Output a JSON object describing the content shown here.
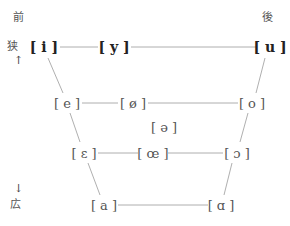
{
  "axes": {
    "front": "前",
    "back": "後",
    "close": "狭",
    "open": "広",
    "up_arrow": "↑",
    "down_arrow": "↓"
  },
  "vowels": {
    "i": "[ i ]",
    "y": "[ y ]",
    "u": "[ u ]",
    "e": "[ e ]",
    "o_slash": "[ ø ]",
    "o": "[ o ]",
    "schwa": "[ ə ]",
    "epsilon": "[ ɛ ]",
    "oe": "[ œ ]",
    "open_o": "[ ɔ ]",
    "a": "[ a ]",
    "alpha": "[ ɑ ]"
  },
  "colors": {
    "line": "#9a9a9a",
    "text": "#555555"
  }
}
